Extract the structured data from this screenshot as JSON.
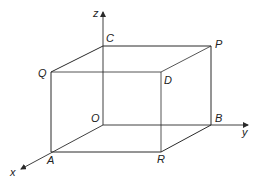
{
  "diagram": {
    "type": "3d-cuboid-axes",
    "colors": {
      "edge": "#2a2a2a",
      "hidden_edge": "#555555",
      "label": "#222222",
      "background": "#ffffff"
    },
    "axes": {
      "x": {
        "label": "x"
      },
      "y": {
        "label": "y"
      },
      "z": {
        "label": "z"
      }
    },
    "vertices": {
      "O": {
        "label": "O"
      },
      "A": {
        "label": "A"
      },
      "B": {
        "label": "B"
      },
      "C": {
        "label": "C"
      },
      "D": {
        "label": "D"
      },
      "P": {
        "label": "P"
      },
      "Q": {
        "label": "Q"
      },
      "R": {
        "label": "R"
      }
    },
    "edges": [
      "OA",
      "OB",
      "OC",
      "AR",
      "RB",
      "AQ",
      "RD",
      "BP",
      "QC",
      "CP",
      "PD",
      "DQ"
    ]
  }
}
